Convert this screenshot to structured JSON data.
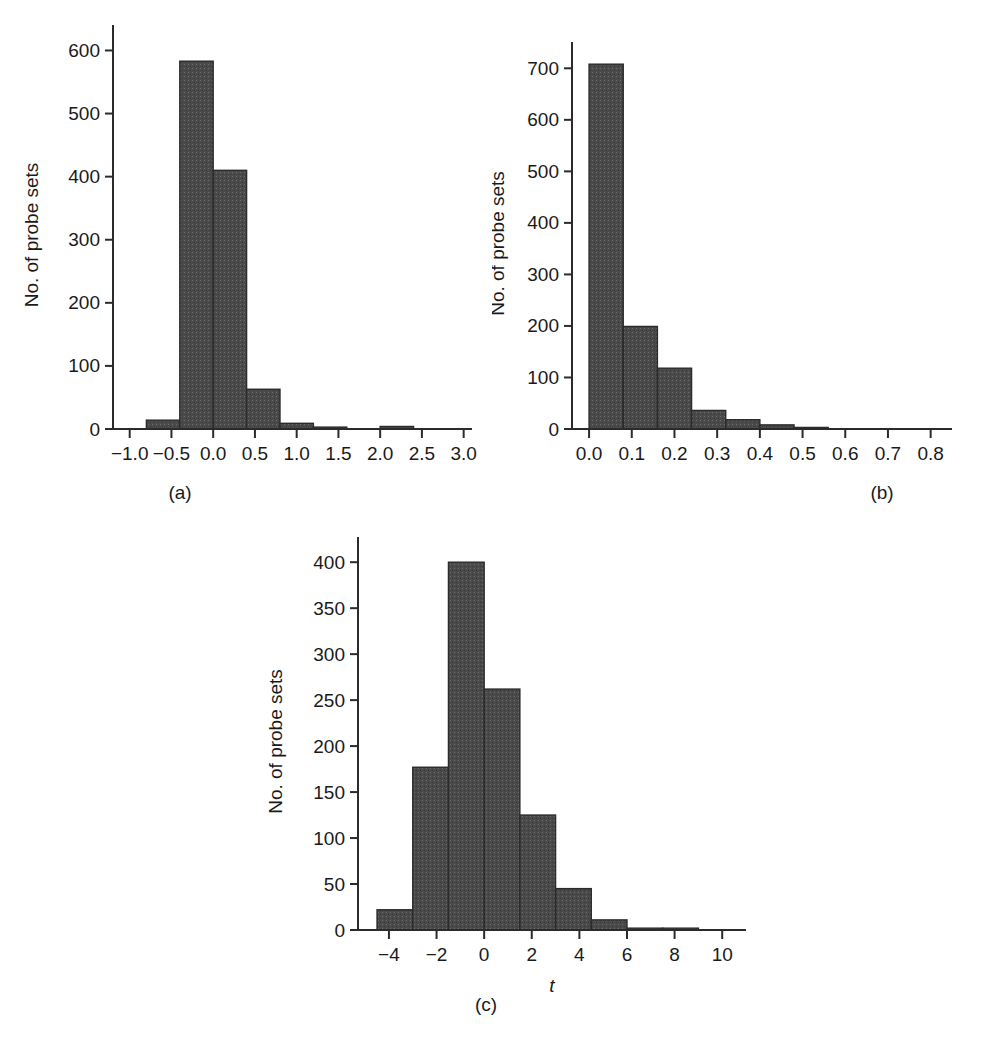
{
  "figure": {
    "background_color": "#ffffff",
    "bar_fill_color": "#4a4a4a",
    "bar_stroke_color": "#2b2b2b",
    "axis_color": "#2b2b2b",
    "y_axis_label": "No. of probe sets"
  },
  "panels": {
    "a": {
      "caption": "(a)",
      "x_axis_label": "b",
      "x_axis_label_style": "italic"
    },
    "b": {
      "caption": "(b)",
      "x_axis_label_prefix": "SE",
      "x_axis_label_sub": "b"
    },
    "c": {
      "caption": "(c)",
      "x_axis_label": "t",
      "x_axis_label_style": "italic"
    }
  },
  "chart_data": [
    {
      "type": "bar",
      "panel": "a",
      "title": "",
      "xlabel": "b",
      "ylabel": "No. of probe sets",
      "xlim": [
        -1.2,
        3.1
      ],
      "ylim": [
        0,
        615
      ],
      "xticks": [
        -1.0,
        -0.5,
        0.0,
        0.5,
        1.0,
        1.5,
        2.0,
        2.5,
        3.0
      ],
      "xtick_labels": [
        "−1.0",
        "−0.5",
        "0.0",
        "0.5",
        "1.0",
        "1.5",
        "2.0",
        "2.5",
        "3.0"
      ],
      "yticks": [
        0,
        100,
        200,
        300,
        400,
        500,
        600
      ],
      "ytick_labels": [
        "0",
        "100",
        "200",
        "300",
        "400",
        "500",
        "600"
      ],
      "grid": false,
      "legend": "none",
      "bin_edges": [
        -0.8,
        -0.4,
        0.0,
        0.4,
        0.8,
        1.2,
        1.6,
        2.0,
        2.4
      ],
      "categories": [
        "-0.8 to -0.4",
        "-0.4 to 0.0",
        "0.0 to 0.4",
        "0.4 to 0.8",
        "0.8 to 1.2",
        "1.2 to 1.6",
        "2.0 to 2.4"
      ],
      "bars": [
        {
          "x0": -0.8,
          "x1": -0.4,
          "value": 14
        },
        {
          "x0": -0.4,
          "x1": 0.0,
          "value": 583
        },
        {
          "x0": 0.0,
          "x1": 0.4,
          "value": 410
        },
        {
          "x0": 0.4,
          "x1": 0.8,
          "value": 63
        },
        {
          "x0": 0.8,
          "x1": 1.2,
          "value": 9
        },
        {
          "x0": 1.2,
          "x1": 1.6,
          "value": 3
        },
        {
          "x0": 2.0,
          "x1": 2.4,
          "value": 4
        }
      ]
    },
    {
      "type": "bar",
      "panel": "b",
      "title": "",
      "xlabel": "SEb",
      "ylabel": "No. of probe sets",
      "xlim": [
        -0.04,
        0.85
      ],
      "ylim": [
        0,
        720
      ],
      "xticks": [
        0.0,
        0.1,
        0.2,
        0.3,
        0.4,
        0.5,
        0.6,
        0.7,
        0.8
      ],
      "xtick_labels": [
        "0.0",
        "0.1",
        "0.2",
        "0.3",
        "0.4",
        "0.5",
        "0.6",
        "0.7",
        "0.8"
      ],
      "yticks": [
        0,
        100,
        200,
        300,
        400,
        500,
        600,
        700
      ],
      "ytick_labels": [
        "0",
        "100",
        "200",
        "300",
        "400",
        "500",
        "600",
        "700"
      ],
      "grid": false,
      "legend": "none",
      "bin_edges": [
        0.0,
        0.08,
        0.16,
        0.24,
        0.32,
        0.4,
        0.48,
        0.56
      ],
      "categories": [
        "0.00-0.08",
        "0.08-0.16",
        "0.16-0.24",
        "0.24-0.32",
        "0.32-0.40",
        "0.40-0.48",
        "0.48-0.56"
      ],
      "bars": [
        {
          "x0": 0.0,
          "x1": 0.08,
          "value": 708
        },
        {
          "x0": 0.08,
          "x1": 0.16,
          "value": 199
        },
        {
          "x0": 0.16,
          "x1": 0.24,
          "value": 118
        },
        {
          "x0": 0.24,
          "x1": 0.32,
          "value": 36
        },
        {
          "x0": 0.32,
          "x1": 0.4,
          "value": 18
        },
        {
          "x0": 0.4,
          "x1": 0.48,
          "value": 8
        },
        {
          "x0": 0.48,
          "x1": 0.56,
          "value": 3
        }
      ]
    },
    {
      "type": "bar",
      "panel": "c",
      "title": "",
      "xlabel": "t",
      "ylabel": "No. of probe sets",
      "xlim": [
        -5.3,
        11.0
      ],
      "ylim": [
        0,
        410
      ],
      "xticks": [
        -4,
        -2,
        0,
        2,
        4,
        6,
        8,
        10
      ],
      "xtick_labels": [
        "−4",
        "−2",
        "0",
        "2",
        "4",
        "6",
        "8",
        "10"
      ],
      "yticks": [
        0,
        50,
        100,
        150,
        200,
        250,
        300,
        350,
        400
      ],
      "ytick_labels": [
        "0",
        "50",
        "100",
        "150",
        "200",
        "250",
        "300",
        "350",
        "400"
      ],
      "grid": false,
      "legend": "none",
      "bin_edges": [
        -4.5,
        -3.0,
        -1.5,
        0.0,
        1.5,
        3.0,
        4.5,
        6.0,
        7.5,
        9.0
      ],
      "categories": [
        "-4.5 to -3",
        "-3 to -1.5",
        "-1.5 to 0",
        "0 to 1.5",
        "1.5 to 3",
        "3 to 4.5",
        "4.5 to 6",
        "6 to 7.5",
        "7.5 to 9"
      ],
      "bars": [
        {
          "x0": -4.5,
          "x1": -3.0,
          "value": 22
        },
        {
          "x0": -3.0,
          "x1": -1.5,
          "value": 177
        },
        {
          "x0": -1.5,
          "x1": 0.0,
          "value": 400
        },
        {
          "x0": 0.0,
          "x1": 1.5,
          "value": 262
        },
        {
          "x0": 1.5,
          "x1": 3.0,
          "value": 125
        },
        {
          "x0": 3.0,
          "x1": 4.5,
          "value": 45
        },
        {
          "x0": 4.5,
          "x1": 6.0,
          "value": 11
        },
        {
          "x0": 6.0,
          "x1": 7.5,
          "value": 2
        },
        {
          "x0": 7.5,
          "x1": 9.0,
          "value": 2
        }
      ]
    }
  ]
}
